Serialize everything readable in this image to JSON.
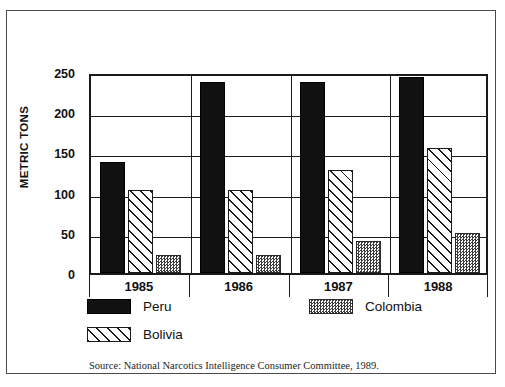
{
  "page": {
    "header_artifact": "",
    "source_note": "Source: National Narcotics Intelligence Consumer Committee, 1989."
  },
  "chart_data": {
    "type": "bar",
    "title": "",
    "xlabel": "",
    "ylabel": "METRIC TONS",
    "ylim": [
      0,
      250
    ],
    "yticks": [
      0,
      50,
      100,
      150,
      200,
      250
    ],
    "ytick_labels": [
      "0",
      "50",
      "100",
      "150",
      "200",
      "250"
    ],
    "grid": true,
    "legend_position": "below-plot",
    "categories": [
      "1985",
      "1986",
      "1987",
      "1988"
    ],
    "series": [
      {
        "name": "Peru",
        "pattern": "solid-black",
        "color": "#111111",
        "values": [
          138,
          238,
          238,
          244
        ]
      },
      {
        "name": "Bolivia",
        "pattern": "diagonal-hatch",
        "color": "#ffffff",
        "values": [
          103,
          103,
          128,
          155
        ]
      },
      {
        "name": "Colombia",
        "pattern": "checker-gray",
        "color": "#3b3b3b",
        "values": [
          23,
          23,
          40,
          50
        ]
      }
    ]
  },
  "legend": {
    "items": [
      {
        "label": "Peru",
        "key": "peru"
      },
      {
        "label": "Colombia",
        "key": "colombia"
      },
      {
        "label": "Bolivia",
        "key": "bolivia"
      }
    ]
  }
}
